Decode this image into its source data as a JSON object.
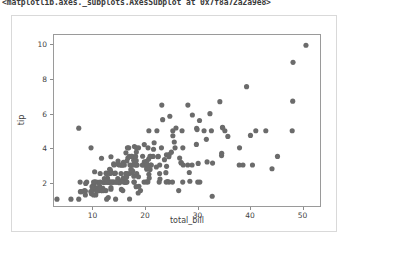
{
  "cell_output": {
    "repr_text": "<matplotlib.axes._subplots.AxesSubplot at 0x7f8a72a2a9e8>"
  },
  "figure": {
    "background_color": "#ffffff",
    "border_color": "#d9d9d9",
    "axes_spine_color": "#9a9a9a",
    "marker_color": "#6b6b6b"
  },
  "chart_data": {
    "type": "scatter",
    "title": "",
    "xlabel": "total_bill",
    "ylabel": "tip",
    "xlim": [
      2.5,
      53.5
    ],
    "ylim": [
      0.6,
      10.6
    ],
    "xticks": [
      10,
      20,
      30,
      40,
      50
    ],
    "yticks": [
      2,
      4,
      6,
      8,
      10
    ],
    "xtick_labels": [
      "10",
      "20",
      "30",
      "40",
      "50"
    ],
    "ytick_labels": [
      "2",
      "4",
      "6",
      "8",
      "10"
    ],
    "grid": false,
    "legend": null,
    "marker": "o",
    "marker_size": 2.6,
    "n_points": 244,
    "x": [
      16.99,
      10.34,
      21.01,
      23.68,
      24.59,
      25.29,
      8.77,
      26.88,
      15.04,
      14.78,
      10.27,
      35.26,
      15.42,
      18.43,
      14.83,
      21.58,
      10.33,
      16.29,
      16.97,
      20.65,
      17.92,
      20.29,
      15.77,
      39.42,
      19.82,
      17.81,
      13.37,
      12.69,
      21.7,
      19.65,
      9.55,
      18.35,
      15.06,
      20.69,
      17.78,
      24.06,
      16.31,
      16.93,
      18.69,
      31.27,
      16.04,
      17.46,
      13.94,
      9.68,
      30.4,
      18.29,
      22.23,
      32.4,
      28.55,
      18.04,
      12.54,
      10.29,
      34.81,
      9.94,
      25.56,
      19.49,
      38.01,
      26.41,
      11.24,
      48.27,
      20.29,
      13.81,
      11.02,
      18.29,
      17.59,
      20.08,
      16.45,
      3.07,
      20.23,
      15.01,
      12.02,
      17.07,
      26.86,
      25.28,
      14.73,
      10.51,
      17.92,
      27.2,
      22.76,
      17.29,
      19.44,
      16.66,
      10.07,
      32.68,
      15.98,
      34.83,
      13.03,
      18.28,
      24.71,
      21.16,
      28.97,
      22.49,
      5.75,
      16.32,
      22.75,
      40.17,
      27.28,
      12.03,
      21.01,
      12.46,
      11.35,
      15.38,
      44.3,
      22.42,
      20.92,
      15.36,
      20.49,
      25.21,
      18.24,
      14.31,
      14.0,
      7.25,
      38.07,
      23.95,
      25.71,
      17.31,
      29.93,
      10.65,
      12.43,
      24.08,
      11.69,
      13.42,
      14.26,
      15.95,
      12.48,
      29.8,
      8.52,
      14.52,
      11.38,
      22.82,
      19.08,
      20.27,
      11.17,
      12.26,
      18.26,
      8.51,
      10.33,
      14.15,
      16.0,
      13.16,
      17.47,
      34.3,
      41.19,
      27.05,
      16.43,
      8.35,
      18.64,
      11.87,
      9.78,
      7.51,
      14.07,
      13.13,
      17.26,
      24.55,
      19.77,
      29.85,
      48.17,
      25.0,
      13.39,
      16.49,
      21.5,
      12.66,
      16.21,
      13.81,
      17.51,
      24.52,
      20.76,
      31.71,
      10.59,
      10.63,
      50.81,
      15.81,
      7.25,
      31.85,
      16.82,
      32.9,
      17.89,
      14.48,
      9.6,
      34.63,
      34.65,
      23.33,
      45.35,
      23.17,
      40.55,
      20.69,
      20.9,
      30.46,
      18.15,
      23.1,
      15.69,
      19.81,
      28.44,
      15.48,
      16.58,
      7.56,
      10.34,
      43.11,
      13.0,
      13.51,
      18.71,
      12.74,
      13.0,
      16.4,
      20.53,
      16.47,
      26.59,
      38.73,
      24.27,
      12.76,
      30.06,
      25.89,
      48.33,
      13.27,
      28.17,
      12.9,
      28.15,
      11.59,
      7.74,
      30.14,
      12.16,
      13.42,
      8.58,
      15.98,
      13.42,
      16.27,
      10.09,
      20.45,
      13.28,
      22.12,
      24.01,
      15.69,
      11.61,
      10.77,
      15.53,
      10.07,
      12.6,
      32.83,
      35.83,
      29.03,
      27.18,
      22.67,
      17.82,
      18.78
    ],
    "y": [
      1.01,
      1.66,
      3.5,
      3.31,
      3.61,
      4.71,
      2.0,
      3.12,
      1.96,
      3.23,
      1.71,
      5.0,
      1.57,
      3.0,
      3.02,
      3.92,
      1.67,
      3.71,
      3.5,
      3.35,
      4.08,
      2.75,
      2.23,
      7.58,
      3.18,
      2.34,
      2.0,
      2.0,
      4.3,
      3.0,
      1.45,
      2.5,
      3.0,
      2.45,
      3.27,
      3.6,
      2.0,
      2.5,
      2.31,
      5.0,
      2.24,
      2.54,
      3.06,
      1.32,
      5.6,
      3.0,
      5.0,
      6.0,
      2.05,
      3.0,
      2.5,
      2.6,
      5.2,
      1.56,
      4.34,
      3.51,
      3.0,
      1.5,
      1.76,
      6.73,
      3.21,
      2.0,
      1.98,
      3.76,
      2.64,
      3.15,
      2.47,
      1.0,
      2.01,
      2.09,
      1.97,
      3.0,
      3.14,
      5.0,
      2.2,
      1.25,
      3.08,
      4.0,
      3.0,
      2.71,
      3.0,
      3.4,
      1.83,
      5.0,
      2.03,
      5.17,
      2.0,
      4.0,
      5.85,
      3.0,
      3.0,
      3.5,
      1.0,
      2.05,
      2.5,
      4.73,
      3.0,
      1.5,
      3.0,
      1.5,
      2.5,
      3.0,
      2.78,
      3.48,
      2.74,
      2.5,
      2.01,
      2.0,
      1.73,
      1.0,
      3.0,
      1.0,
      4.0,
      2.55,
      4.0,
      3.5,
      5.07,
      1.5,
      2.0,
      2.92,
      1.5,
      1.68,
      2.52,
      2.0,
      2.52,
      4.2,
      1.48,
      2.0,
      2.0,
      2.18,
      1.5,
      2.83,
      1.5,
      2.0,
      3.25,
      1.25,
      2.0,
      2.0,
      2.0,
      2.75,
      3.5,
      6.7,
      5.0,
      5.0,
      2.3,
      1.5,
      1.36,
      1.63,
      1.73,
      2.0,
      2.5,
      2.0,
      2.74,
      2.0,
      2.0,
      5.14,
      5.0,
      3.75,
      2.61,
      2.0,
      3.5,
      2.5,
      2.0,
      2.0,
      3.0,
      3.48,
      2.24,
      4.5,
      1.61,
      2.0,
      10.0,
      3.16,
      5.15,
      3.18,
      4.0,
      3.11,
      2.0,
      2.0,
      4.0,
      3.55,
      3.68,
      5.65,
      3.5,
      6.5,
      3.0,
      5.0,
      3.5,
      2.0,
      3.5,
      4.0,
      1.5,
      4.19,
      2.56,
      2.02,
      4.0,
      1.44,
      2.0,
      5.0,
      2.0,
      2.0,
      4.0,
      2.01,
      2.0,
      2.5,
      4.0,
      3.23,
      3.41,
      3.0,
      2.03,
      2.23,
      2.0,
      5.16,
      9.0,
      2.5,
      6.5,
      1.1,
      3.0,
      1.5,
      1.44,
      3.09,
      2.2,
      3.48,
      1.92,
      3.0,
      1.58,
      2.5,
      2.0,
      3.0,
      2.72,
      2.88,
      2.0,
      3.0,
      3.39,
      1.47,
      3.0,
      1.25,
      1.0,
      1.17,
      4.67,
      5.92,
      2.0,
      2.0,
      2.0,
      1.75,
      3.0
    ]
  }
}
